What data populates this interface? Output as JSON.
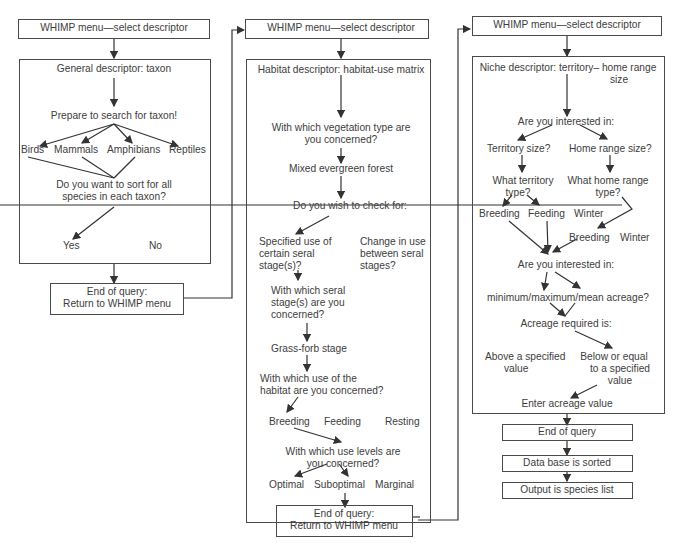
{
  "column1": {
    "menu": "WHIMP menu—select descriptor",
    "descriptor": "General descriptor: taxon",
    "prepare": "Prepare to search for taxon!",
    "taxa": [
      "Birds",
      "Mammals",
      "Amphibians",
      "Reptiles"
    ],
    "sort_q_line1": "Do you want to sort for all",
    "sort_q_line2": "species in each taxon?",
    "yes": "Yes",
    "no": "No",
    "end_line1": "End of query:",
    "end_line2": "Return to WHIMP menu"
  },
  "column2": {
    "menu": "WHIMP menu—select descriptor",
    "descriptor": "Habitat descriptor: habitat-use matrix",
    "veg_q_line1": "With which vegetation type are",
    "veg_q_line2": "you concerned?",
    "veg_answer": "Mixed evergreen forest",
    "check_q": "Do you wish to check for:",
    "specified_line1": "Specified use of",
    "specified_line2": "certain seral",
    "specified_line3": "stage(s)?",
    "change_line1": "Change in use",
    "change_line2": "between seral",
    "change_line3": "stages?",
    "seral_q_line1": "With which seral",
    "seral_q_line2": "stage(s) are you",
    "seral_q_line3": "concerned?",
    "seral_answer": "Grass-forb stage",
    "use_q_line1": "With which use of the",
    "use_q_line2": "habitat are you concerned?",
    "uses": [
      "Breeding",
      "Feeding",
      "Resting"
    ],
    "level_q_line1": "With which use levels are",
    "level_q_line2": "you concerned?",
    "levels": [
      "Optimal",
      "Suboptimal",
      "Marginal"
    ],
    "end_line1": "End of query:",
    "end_line2": "Return to WHIMP menu"
  },
  "column3": {
    "menu": "WHIMP menu—select descriptor",
    "descriptor_line1": "Niche descriptor: territory–  home range",
    "descriptor_line2": "size",
    "interest_q": "Are you interested in:",
    "territory_size": "Territory size?",
    "home_range_size": "Home range size?",
    "territory_type_line1": "What territory",
    "territory_type_line2": "type?",
    "home_type_line1": "What home range",
    "home_type_line2": "type?",
    "territory_types": [
      "Breeding",
      "Feeding",
      "Winter"
    ],
    "home_types": [
      "Breeding",
      "Winter"
    ],
    "interest_q2": "Are you interested in:",
    "acreage_options": "minimum/maximum/mean acreage?",
    "acreage_required": "Acreage required is:",
    "above_line1": "Above a specified",
    "above_line2": "value",
    "below_line1": "Below or equal",
    "below_line2": "to a specified",
    "below_line3": "value",
    "enter_value": "Enter acreage value",
    "end_query": "End of query",
    "sorted": "Data base is sorted",
    "output": "Output is species list"
  }
}
